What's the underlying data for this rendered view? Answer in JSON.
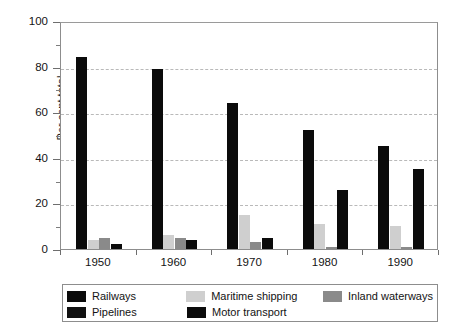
{
  "chart_data": {
    "type": "bar",
    "title": "",
    "xlabel": "",
    "ylabel": "Per cent total",
    "ylim": [
      0,
      100
    ],
    "ytick_labels": [
      "0",
      "20",
      "40",
      "60",
      "80",
      "100"
    ],
    "ytick_values": [
      0,
      20,
      40,
      60,
      80,
      100
    ],
    "yminor_values": [
      10,
      30,
      50,
      70,
      90
    ],
    "grid": "horizontal-dashed",
    "legend_position": "bottom",
    "categories": [
      "1950",
      "1960",
      "1970",
      "1980",
      "1990"
    ],
    "series": [
      {
        "name": "Railways",
        "key": "railways",
        "color": "#0b0b0b",
        "values": [
          84,
          79,
          64,
          52,
          45
        ]
      },
      {
        "name": "Pipelines",
        "key": "pipelines",
        "color": "#111111",
        "values": [
          0,
          0,
          0,
          0,
          0
        ]
      },
      {
        "name": "Maritime shipping",
        "key": "maritime",
        "color": "#cfcfcf",
        "values": [
          4,
          6,
          15,
          11,
          10
        ]
      },
      {
        "name": "Inland waterways",
        "key": "inland",
        "color": "#8a8a8a",
        "values": [
          5,
          5,
          3,
          1,
          1
        ]
      },
      {
        "name": "Motor transport",
        "key": "motor",
        "color": "#0b0b0b",
        "values": [
          2,
          4,
          5,
          26,
          35
        ]
      }
    ]
  },
  "legend": {
    "items": [
      {
        "label": "Railways",
        "key": "railways"
      },
      {
        "label": "Pipelines",
        "key": "pipelines"
      },
      {
        "label": "Maritime shipping",
        "key": "maritime"
      },
      {
        "label": "Motor transport",
        "key": "motor"
      },
      {
        "label": "Inland waterways",
        "key": "inland"
      }
    ]
  }
}
